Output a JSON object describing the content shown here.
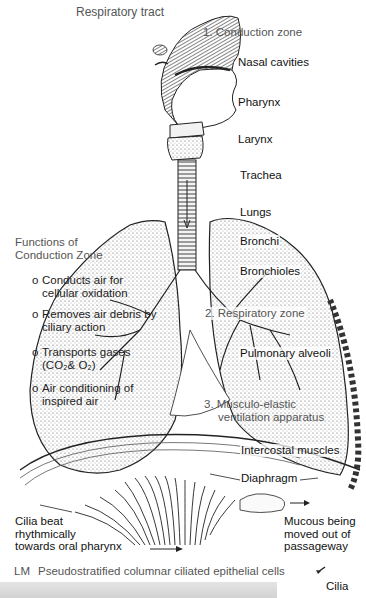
{
  "title": "Respiratory tract",
  "zones": {
    "conduction": "1. Conduction zone",
    "respiratory": "2. Respiratory zone",
    "ventilation_line1": "3. Musculo-elastic",
    "ventilation_line2": "ventilation apparatus"
  },
  "structures": {
    "nasal_cavities": "Nasal cavities",
    "pharynx": "Pharynx",
    "larynx": "Larynx",
    "trachea": "Trachea",
    "lungs": "Lungs",
    "bronchi": "Bronchi",
    "bronchioles": "Bronchioles",
    "pulmonary_alveoli": "Pulmonary alveoli",
    "intercostal_muscles": "Intercostal muscles",
    "diaphragm": "Diaphragm"
  },
  "functions": {
    "heading_line1": "Functions of",
    "heading_line2": "Conduction Zone",
    "bullet": "o",
    "items": [
      {
        "line1": "Conducts air for",
        "line2": "cellular oxidation"
      },
      {
        "line1": "Removes air debris by",
        "line2": "ciliary action"
      },
      {
        "line1": "Transports gases",
        "line2": "(CO₂& O₂)"
      },
      {
        "line1": "Air conditioning of",
        "line2": "inspired air"
      }
    ]
  },
  "cilia": {
    "left_line1": "Cilia beat",
    "left_line2": "rhythmically",
    "left_line3": "towards oral pharynx",
    "right_line1": "Mucous being",
    "right_line2": "moved out of",
    "right_line3": "passageway"
  },
  "micrograph": {
    "prefix": "LM",
    "caption": "Pseudostratified columnar ciliated epithelial cells",
    "cilia_label": "Cilia"
  }
}
